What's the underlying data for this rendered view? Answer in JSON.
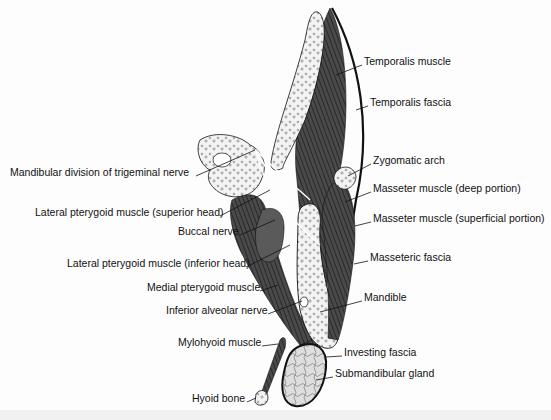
{
  "figure": {
    "type": "anatomical cross-section",
    "colors": {
      "muscle": "#3a3a3a",
      "bone": "#f2f2f2",
      "gland": "#dcdcdc",
      "line": "#111111",
      "background": "#fdfdfd"
    }
  },
  "labels_left": [
    {
      "text": "Mandibular division of trigeminal nerve",
      "x": 10,
      "y": 172
    },
    {
      "text": "Lateral pterygoid muscle (superior head)",
      "x": 35,
      "y": 212
    },
    {
      "text": "Buccal nerve",
      "x": 178,
      "y": 231
    },
    {
      "text": "Lateral pterygoid muscle (inferior head)",
      "x": 67,
      "y": 263
    },
    {
      "text": "Medial pterygoid muscle",
      "x": 147,
      "y": 287
    },
    {
      "text": "Inferior alveolar nerve",
      "x": 166,
      "y": 310
    },
    {
      "text": "Mylohyoid muscle",
      "x": 178,
      "y": 342
    },
    {
      "text": "Hyoid bone",
      "x": 192,
      "y": 398
    }
  ],
  "labels_right": [
    {
      "text": "Temporalis muscle",
      "x": 364,
      "y": 61
    },
    {
      "text": "Temporalis fascia",
      "x": 370,
      "y": 102
    },
    {
      "text": "Zygomatic arch",
      "x": 373,
      "y": 160
    },
    {
      "text": "Masseter muscle (deep portion)",
      "x": 373,
      "y": 188
    },
    {
      "text": "Masseter muscle (superficial portion)",
      "x": 373,
      "y": 218
    },
    {
      "text": "Masseteric fascia",
      "x": 370,
      "y": 257
    },
    {
      "text": "Mandible",
      "x": 364,
      "y": 297
    },
    {
      "text": "Investing fascia",
      "x": 344,
      "y": 352
    },
    {
      "text": "Submandibular gland",
      "x": 335,
      "y": 373
    }
  ]
}
